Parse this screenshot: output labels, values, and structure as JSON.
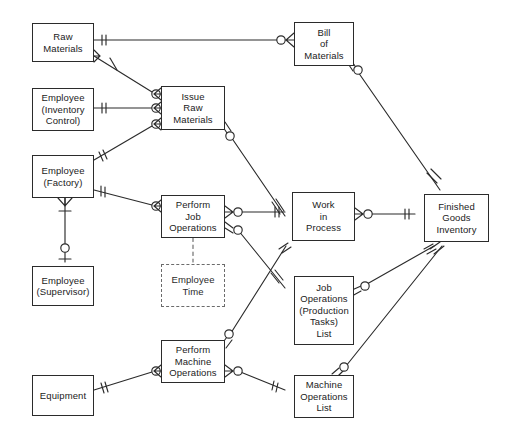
{
  "diagram": {
    "notation": "crow's-foot (IE) ERD",
    "background_color": "#ffffff",
    "line_color": "#2b2b2b",
    "text_color": "#1b1b1b",
    "entities": [
      {
        "id": "raw-materials",
        "label": "Raw\nMaterials",
        "x": 32,
        "y": 23,
        "w": 62,
        "h": 39,
        "style": "solid"
      },
      {
        "id": "employee-inventory",
        "label": "Employee\n(Inventory\nControl)",
        "x": 32,
        "y": 88,
        "w": 62,
        "h": 43,
        "style": "solid"
      },
      {
        "id": "employee-factory",
        "label": "Employee\n(Factory)",
        "x": 32,
        "y": 155,
        "w": 62,
        "h": 43,
        "style": "solid"
      },
      {
        "id": "employee-supervisor",
        "label": "Employee\n(Supervisor)",
        "x": 32,
        "y": 266,
        "w": 62,
        "h": 40,
        "style": "solid"
      },
      {
        "id": "equipment",
        "label": "Equipment",
        "x": 32,
        "y": 375,
        "w": 62,
        "h": 41,
        "style": "solid"
      },
      {
        "id": "issue-raw-materials",
        "label": "Issue\nRaw\nMaterials",
        "x": 161,
        "y": 86,
        "w": 64,
        "h": 44,
        "style": "solid"
      },
      {
        "id": "perform-job-ops",
        "label": "Perform\nJob\nOperations",
        "x": 161,
        "y": 195,
        "w": 64,
        "h": 43,
        "style": "solid"
      },
      {
        "id": "employee-time",
        "label": "Employee\nTime",
        "x": 161,
        "y": 264,
        "w": 64,
        "h": 43,
        "style": "dashed"
      },
      {
        "id": "perform-machine-ops",
        "label": "Perform\nMachine\nOperations",
        "x": 161,
        "y": 340,
        "w": 64,
        "h": 43,
        "style": "solid"
      },
      {
        "id": "bill-of-materials",
        "label": "Bill\nof\nMaterials",
        "x": 294,
        "y": 22,
        "w": 60,
        "h": 44,
        "style": "solid"
      },
      {
        "id": "work-in-process",
        "label": "Work\nin\nProcess",
        "x": 292,
        "y": 192,
        "w": 63,
        "h": 49,
        "style": "solid"
      },
      {
        "id": "job-operations-list",
        "label": "Job\nOperations\n(Production\nTasks)\nList",
        "x": 294,
        "y": 276,
        "w": 60,
        "h": 69,
        "style": "solid"
      },
      {
        "id": "machine-operations-list",
        "label": "Machine\nOperations\nList",
        "x": 294,
        "y": 375,
        "w": 60,
        "h": 43,
        "style": "solid"
      },
      {
        "id": "finished-goods",
        "label": "Finished\nGoods\nInventory",
        "x": 424,
        "y": 194,
        "w": 65,
        "h": 48,
        "style": "solid"
      }
    ],
    "relationships": [
      {
        "id": "rel-rawmat-bom",
        "from": "raw-materials",
        "to": "bill-of-materials",
        "from_marker": "one-mandatory",
        "to_marker": "many-optional"
      },
      {
        "id": "rel-rawmat-issue",
        "from": "raw-materials",
        "to": "issue-raw-materials",
        "from_marker": "many",
        "to_marker": "many-optional"
      },
      {
        "id": "rel-empinv-issue",
        "from": "employee-inventory",
        "to": "issue-raw-materials",
        "from_marker": "one-mandatory",
        "to_marker": "many-optional"
      },
      {
        "id": "rel-empfac-issue",
        "from": "employee-factory",
        "to": "issue-raw-materials",
        "from_marker": "one-mandatory",
        "to_marker": "many-optional"
      },
      {
        "id": "rel-empfac-jobops",
        "from": "employee-factory",
        "to": "perform-job-ops",
        "from_marker": "one-mandatory",
        "to_marker": "many-optional"
      },
      {
        "id": "rel-empfac-supervisor",
        "from": "employee-factory",
        "to": "employee-supervisor",
        "from_marker": "many",
        "to_marker": "one-optional"
      },
      {
        "id": "rel-issue-wip",
        "from": "issue-raw-materials",
        "to": "work-in-process",
        "from_marker": "many-optional",
        "to_marker": "one-mandatory"
      },
      {
        "id": "rel-jobops-wip",
        "from": "perform-job-ops",
        "to": "work-in-process",
        "from_marker": "many-optional",
        "to_marker": "one-mandatory"
      },
      {
        "id": "rel-jobops-joblist",
        "from": "perform-job-ops",
        "to": "job-operations-list",
        "from_marker": "many-optional",
        "to_marker": "one-mandatory"
      },
      {
        "id": "rel-machops-joblist",
        "from": "perform-machine-ops",
        "to": "work-in-process",
        "from_marker": "many-optional",
        "to_marker": "one-mandatory"
      },
      {
        "id": "rel-wip-fgi",
        "from": "work-in-process",
        "to": "finished-goods",
        "from_marker": "many-optional",
        "to_marker": "one-mandatory"
      },
      {
        "id": "rel-bom-fgi",
        "from": "bill-of-materials",
        "to": "finished-goods",
        "from_marker": "many-optional",
        "to_marker": "one-mandatory"
      },
      {
        "id": "rel-joblist-fgi",
        "from": "job-operations-list",
        "to": "finished-goods",
        "from_marker": "many-optional",
        "to_marker": "one-mandatory"
      },
      {
        "id": "rel-machlist-fgi",
        "from": "machine-operations-list",
        "to": "finished-goods",
        "from_marker": "many-optional",
        "to_marker": "one-mandatory"
      },
      {
        "id": "rel-equip-machops",
        "from": "equipment",
        "to": "perform-machine-ops",
        "from_marker": "one-mandatory",
        "to_marker": "many-optional"
      },
      {
        "id": "rel-machops-machlist",
        "from": "perform-machine-ops",
        "to": "machine-operations-list",
        "from_marker": "many-optional",
        "to_marker": "one-mandatory"
      },
      {
        "id": "rel-jobops-emptime",
        "from": "perform-job-ops",
        "to": "employee-time",
        "from_marker": "none",
        "to_marker": "none",
        "style": "dashed"
      }
    ]
  }
}
